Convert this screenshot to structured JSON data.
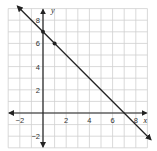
{
  "chart_data": {
    "type": "line",
    "title": "",
    "xlabel": "x",
    "ylabel": "y",
    "xlim": [
      -3,
      9
    ],
    "ylim": [
      -3,
      9
    ],
    "grid": true,
    "x_ticks": [
      "-2",
      "2",
      "4",
      "6",
      "8"
    ],
    "y_ticks": [
      "8",
      "6",
      "4",
      "2",
      "-2"
    ],
    "series": [
      {
        "name": "line",
        "equation": "y = -x + 7",
        "slope": -1,
        "y_intercept": 7,
        "x_intercept": 7,
        "arrows": "both",
        "points": [
          {
            "x": 0,
            "y": 7
          },
          {
            "x": 1,
            "y": 6
          }
        ]
      }
    ]
  },
  "colors": {
    "grid": "#cfcfcf",
    "axis": "#222222",
    "line": "#222222"
  }
}
